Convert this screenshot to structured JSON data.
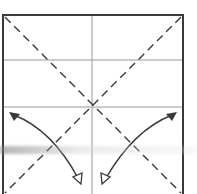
{
  "diagram": {
    "type": "origami-fold-diagram",
    "canvas": {
      "width": 197,
      "height": 194
    },
    "colors": {
      "border": "#3a3a3a",
      "crease_line": "#9a9a9a",
      "dashed_valley_fold": "#3a3a3a",
      "arrow": "#3a3a3a",
      "background": "#ffffff"
    },
    "square": {
      "x1": 3,
      "y1": 15,
      "x2": 183,
      "y2": 196
    },
    "crease_lines": [
      {
        "name": "vertical-center-crease",
        "x1": 92,
        "y1": 15,
        "x2": 92,
        "y2": 194
      },
      {
        "name": "horizontal-crease-upper",
        "x1": 3,
        "y1": 60,
        "x2": 183,
        "y2": 60
      },
      {
        "name": "horizontal-crease-middle",
        "x1": 3,
        "y1": 107,
        "x2": 183,
        "y2": 107
      }
    ],
    "valley_folds": [
      {
        "name": "diagonal-top-left-to-bottom-right",
        "x1": 5,
        "y1": 17,
        "x2": 181,
        "y2": 193
      },
      {
        "name": "diagonal-top-right-to-bottom-left",
        "x1": 181,
        "y1": 17,
        "x2": 5,
        "y2": 193
      }
    ],
    "arrows": [
      {
        "name": "left-fold-arrow",
        "start": [
          12,
          114
        ],
        "control": [
          45,
          128
        ],
        "end": [
          80,
          182
        ],
        "start_head": "filled",
        "end_head": "hollow"
      },
      {
        "name": "right-fold-arrow",
        "start": [
          175,
          114
        ],
        "control": [
          142,
          128
        ],
        "end": [
          103,
          182
        ],
        "start_head": "filled",
        "end_head": "hollow"
      }
    ]
  }
}
